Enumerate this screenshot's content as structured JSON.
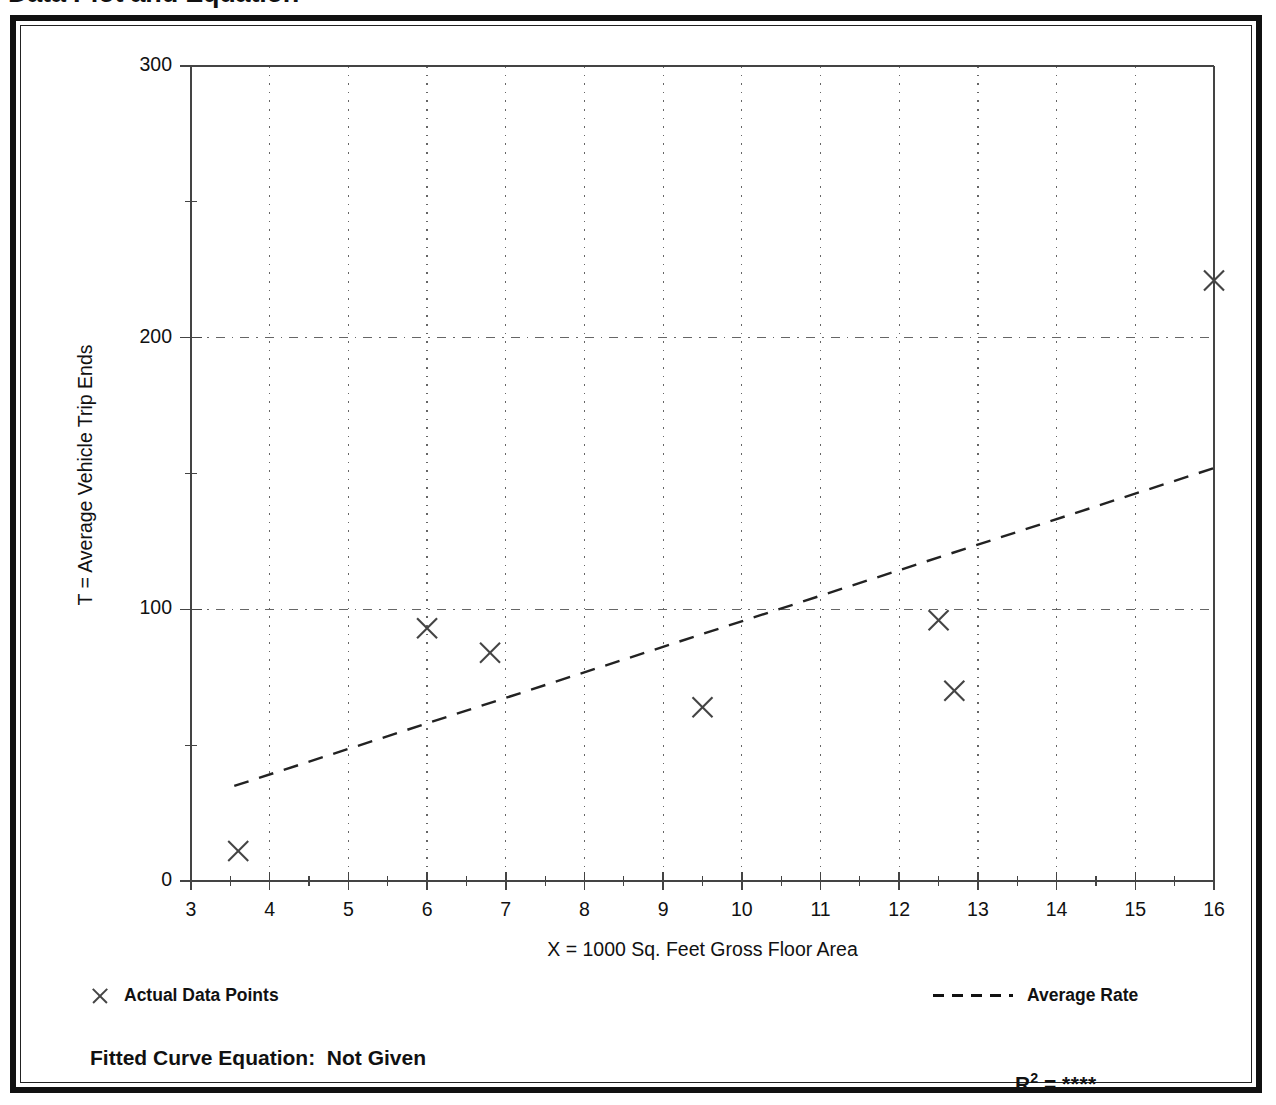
{
  "page": {
    "title": "Data Plot and Equation"
  },
  "chart_data": {
    "type": "scatter",
    "title": "Data Plot and Equation",
    "xlabel": "X = 1000 Sq. Feet Gross Floor Area",
    "ylabel": "T = Average Vehicle Trip Ends",
    "xlim": [
      3,
      16
    ],
    "ylim": [
      0,
      300
    ],
    "grid": true,
    "x_major_ticks": [
      3,
      4,
      5,
      6,
      7,
      8,
      9,
      10,
      11,
      12,
      13,
      14,
      15,
      16
    ],
    "x_tick_labels": [
      "3",
      "4",
      "5",
      "6",
      "7",
      "8",
      "9",
      "10",
      "11",
      "12",
      "13",
      "14",
      "15",
      "16"
    ],
    "x_minor_ticks": [
      3.5,
      4.5,
      5.5,
      6.5,
      7.5,
      8.5,
      9.5,
      10.5,
      11.5,
      12.5,
      13.5,
      14.5,
      15.5
    ],
    "y_major_ticks": [
      0,
      100,
      200,
      300
    ],
    "y_tick_labels": [
      "0",
      "100",
      "200",
      "300"
    ],
    "y_minor_ticks": [
      50,
      150,
      250
    ],
    "gridlines_x": [
      4,
      5,
      6,
      7,
      8,
      9,
      10,
      11,
      12,
      13,
      14,
      15
    ],
    "gridlines_y": [
      100,
      200
    ],
    "series": [
      {
        "name": "Actual Data Points",
        "type": "scatter",
        "marker": "x",
        "points": [
          {
            "x": 3.6,
            "y": 11
          },
          {
            "x": 6.0,
            "y": 93
          },
          {
            "x": 6.8,
            "y": 84
          },
          {
            "x": 9.5,
            "y": 64
          },
          {
            "x": 12.5,
            "y": 96
          },
          {
            "x": 12.7,
            "y": 70
          },
          {
            "x": 16.0,
            "y": 221
          }
        ]
      },
      {
        "name": "Average Rate",
        "type": "line",
        "style": "dashed",
        "endpoints": [
          {
            "x": 3.55,
            "y": 35
          },
          {
            "x": 16.0,
            "y": 152
          }
        ]
      }
    ],
    "legend": {
      "position": "below-axes",
      "entries": [
        {
          "label": "Actual Data Points",
          "marker": "x-icon"
        },
        {
          "label": "Average Rate",
          "marker": "dashed-line-icon"
        }
      ]
    },
    "annotations": {
      "fitted_equation_label": "Fitted Curve Equation:",
      "fitted_equation_value": "Not Given",
      "r_squared_label": "R",
      "r_squared_exponent": "2",
      "r_squared_equals": "=",
      "r_squared_value": "****"
    },
    "colors": {
      "marker": "#444444",
      "line": "#222222",
      "grid": "#666666",
      "axis": "#444444",
      "text": "#111111",
      "frame": "#111111",
      "background": "#ffffff"
    }
  },
  "axis": {
    "y_title": "T = Average Vehicle Trip Ends",
    "x_title": "X = 1000 Sq. Feet Gross Floor Area"
  },
  "legend": {
    "points_label": "Actual Data Points",
    "line_label": "Average Rate"
  },
  "footer": {
    "fitted_equation": "Fitted Curve Equation:  Not Given",
    "r_label": "R",
    "r_exp": "2",
    "r_eq": " = ",
    "r_value": "****"
  }
}
